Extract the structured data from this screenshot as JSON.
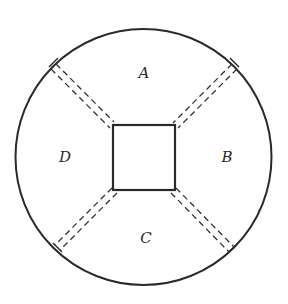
{
  "diagram": {
    "colors": {
      "stroke": "#2a2a2a",
      "background": "#ffffff"
    },
    "outer_circle": {
      "cx": 143.5,
      "cy": 157,
      "r": 128
    },
    "inner_square": {
      "x": 113,
      "y": 125,
      "width": 62,
      "height": 65
    },
    "regions": [
      {
        "id": "A",
        "label": "A",
        "x": 144,
        "y": 78
      },
      {
        "id": "B",
        "label": "B",
        "x": 227,
        "y": 162
      },
      {
        "id": "C",
        "label": "C",
        "x": 146,
        "y": 243
      },
      {
        "id": "D",
        "label": "D",
        "x": 65,
        "y": 162
      }
    ],
    "dashed_channels": [
      {
        "from": "square-top-left",
        "to": "circle-upper-left"
      },
      {
        "from": "square-top-right",
        "to": "circle-upper-right"
      },
      {
        "from": "square-bottom-right",
        "to": "circle-lower-right"
      },
      {
        "from": "square-bottom-left",
        "to": "circle-lower-left"
      }
    ]
  }
}
